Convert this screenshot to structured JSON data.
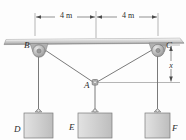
{
  "figure": {
    "labels": {
      "pulley_left": "B",
      "pulley_right": "C",
      "ring_joint": "A",
      "block_left": "D",
      "block_center": "E",
      "block_right": "F"
    },
    "dimensions": {
      "span_left": "4 m",
      "span_right": "4 m",
      "vertical": "x"
    },
    "colors": {
      "line": "#4a4a4a",
      "beam_fill": "#cfcfcf",
      "block_fill": "#cdcdcd",
      "pulley_fill": "#b9b9b9",
      "background": "#fdfdfd"
    }
  }
}
